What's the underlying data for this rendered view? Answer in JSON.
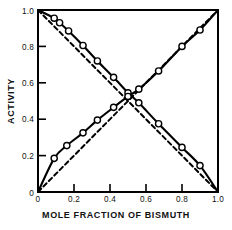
{
  "chart_data": {
    "type": "line",
    "title": "",
    "xlabel": "MOLE FRACTION OF BISMUTH",
    "ylabel": "ACTIVITY",
    "xlim": [
      0,
      1.0
    ],
    "ylim": [
      0,
      1.0
    ],
    "grid": false,
    "legend": "none",
    "xticks": [
      0,
      0.2,
      0.4,
      0.6,
      0.8,
      1.0
    ],
    "xticklabels": [
      "0",
      "0.2",
      "0.4",
      "0.6",
      "0.8",
      "1.0"
    ],
    "yticks": [
      0,
      0.2,
      0.4,
      0.6,
      0.8,
      1.0
    ],
    "yticklabels": [
      "0",
      "0.2",
      "0.4",
      "0.6",
      "0.8",
      "1.0"
    ],
    "series": [
      {
        "name": "activity-descending-solid",
        "style": "solid",
        "marker": "open-circle",
        "color": "#000000",
        "x": [
          0.0,
          0.09,
          0.12,
          0.17,
          0.25,
          0.33,
          0.42,
          0.5,
          0.56,
          0.67,
          0.8,
          0.9,
          1.0
        ],
        "y": [
          1.0,
          0.955,
          0.93,
          0.885,
          0.805,
          0.72,
          0.63,
          0.545,
          0.49,
          0.375,
          0.245,
          0.145,
          0.0
        ]
      },
      {
        "name": "activity-ascending-solid",
        "style": "solid",
        "marker": "open-circle",
        "color": "#000000",
        "x": [
          0.0,
          0.09,
          0.16,
          0.25,
          0.33,
          0.42,
          0.5,
          0.56,
          0.67,
          0.8,
          0.9,
          1.0
        ],
        "y": [
          0.0,
          0.185,
          0.255,
          0.325,
          0.395,
          0.465,
          0.525,
          0.565,
          0.665,
          0.8,
          0.89,
          1.0
        ]
      },
      {
        "name": "ideal-raoult-descending-dashed",
        "style": "dashed",
        "marker": "none",
        "color": "#000000",
        "x": [
          0.0,
          1.0
        ],
        "y": [
          1.0,
          0.0
        ]
      },
      {
        "name": "ideal-raoult-ascending-dashed",
        "style": "dashed",
        "marker": "none",
        "color": "#000000",
        "x": [
          0.0,
          1.0
        ],
        "y": [
          0.0,
          1.0
        ]
      }
    ],
    "annotations": []
  },
  "figure": {
    "background": "#ffffff",
    "axis_color": "#000000",
    "frame": "box"
  }
}
